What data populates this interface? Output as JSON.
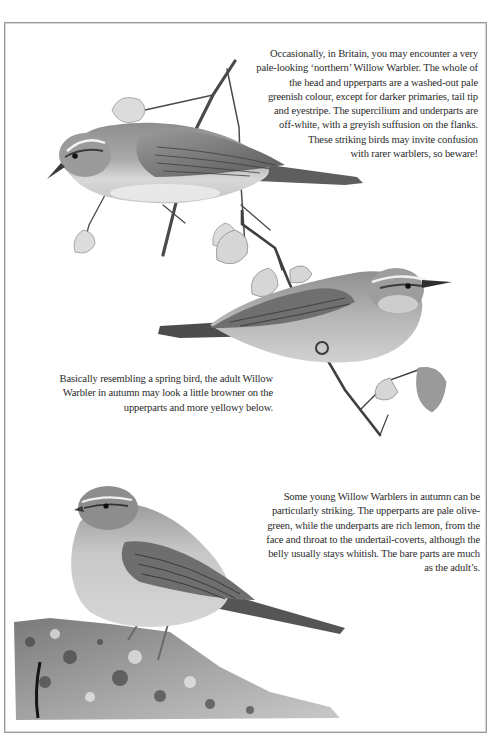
{
  "page": {
    "background": "#ffffff",
    "frame_color": "#9a9a9a"
  },
  "captions": [
    {
      "id": "northern-bird",
      "text": "Occasionally, in Britain, you may encounter a very\npale-looking ‘northern’ Willow Warbler. The whole of\nthe head and upperparts are a washed-out pale\ngreenish colour, except for darker primaries, tail tip\nand eyestripe. The supercilium and underparts are\noff-white, with a greyish suffusion on the flanks.\nThese striking birds may invite confusion\nwith rarer warblers, so beware!"
    },
    {
      "id": "adult-autumn",
      "text": "Basically resembling a spring bird, the adult Willow\nWarbler in autumn may look a little browner on the\nupperparts and more yellowy below."
    },
    {
      "id": "young-autumn",
      "text": "Some young Willow Warblers in autumn can be\nparticularly striking. The upperparts are pale olive-\ngreen, while the underparts are rich lemon, from the\nface and throat to the undertail-coverts, although the\nbelly usually stays whitish. The bare parts are much\nas the adult’s."
    }
  ],
  "illustrations": [
    {
      "subject": "pale northern Willow Warbler perched on twig, facing left",
      "medium": "greyscale painting"
    },
    {
      "subject": "adult autumn Willow Warbler perched on twig, facing right",
      "medium": "greyscale painting"
    },
    {
      "subject": "young autumn Willow Warbler perched on lichen-covered rock, facing left",
      "medium": "greyscale painting"
    }
  ]
}
